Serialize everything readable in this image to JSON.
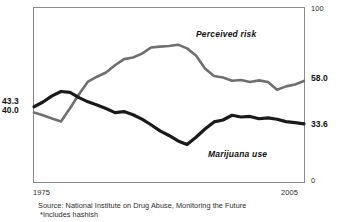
{
  "chart_data": {
    "type": "line",
    "title": "",
    "subtitle": "",
    "xlabel": "",
    "ylabel": "",
    "xlim": [
      1975,
      2005
    ],
    "ylim": [
      0,
      100
    ],
    "grid": false,
    "legend_position": "inline-annotations",
    "axis": {
      "y_right_ticks": [
        "100",
        "0"
      ],
      "y_right_top": "100",
      "y_right_bottom": "0",
      "x_ticks": [
        "1975",
        "2005"
      ],
      "x_start": "1975",
      "x_end": "2005"
    },
    "endpoint_labels": {
      "left_top": "43.3",
      "left_bottom": "40.0",
      "right_perceived_risk": "58.0",
      "right_marijuana_use": "33.6"
    },
    "annotations": [
      {
        "text": "Perceived risk",
        "series": "perceived-risk"
      },
      {
        "text": "Marijuana use",
        "series": "marijuana-use"
      }
    ],
    "series": [
      {
        "name": "Perceived risk",
        "color": "#6f6f6f",
        "start_value": 40.0,
        "end_value": 58.0,
        "x": [
          1975,
          1976,
          1977,
          1978,
          1979,
          1980,
          1981,
          1982,
          1983,
          1984,
          1985,
          1986,
          1987,
          1988,
          1989,
          1990,
          1991,
          1992,
          1993,
          1994,
          1995,
          1996,
          1997,
          1998,
          1999,
          2000,
          2001,
          2002,
          2003,
          2004,
          2005
        ],
        "values": [
          40.0,
          38.5,
          36.6,
          35.0,
          42.5,
          50.4,
          57.6,
          60.4,
          62.8,
          66.9,
          70.4,
          71.3,
          73.5,
          77.0,
          77.5,
          77.8,
          78.6,
          76.5,
          72.5,
          65.0,
          60.8,
          59.9,
          58.1,
          58.5,
          57.4,
          58.3,
          57.4,
          53.0,
          54.9,
          56.0,
          58.0
        ]
      },
      {
        "name": "Marijuana use",
        "color": "#1a1a1a",
        "start_value": 43.3,
        "end_value": 33.6,
        "x": [
          1975,
          1976,
          1977,
          1978,
          1979,
          1980,
          1981,
          1982,
          1983,
          1984,
          1985,
          1986,
          1987,
          1988,
          1989,
          1990,
          1991,
          1992,
          1993,
          1994,
          1995,
          1996,
          1997,
          1998,
          1999,
          2000,
          2001,
          2002,
          2003,
          2004,
          2005
        ],
        "values": [
          43.3,
          46.0,
          49.5,
          52.0,
          51.5,
          48.5,
          46.1,
          44.3,
          42.3,
          40.0,
          40.6,
          38.8,
          36.3,
          33.1,
          29.6,
          27.0,
          23.9,
          21.9,
          26.0,
          30.7,
          34.7,
          35.8,
          38.5,
          37.5,
          37.8,
          36.5,
          37.0,
          36.2,
          34.9,
          34.3,
          33.6
        ]
      }
    ],
    "source": "Source: National Institute on Drug Abuse, Monitoring the Future",
    "footnote": "*Includes hashish"
  },
  "colors": {
    "perceived_risk": "#6f6f6f",
    "marijuana_use": "#1a1a1a",
    "frame": "#8a8a8a",
    "text": "#1a1a1a",
    "background": "#ffffff"
  }
}
